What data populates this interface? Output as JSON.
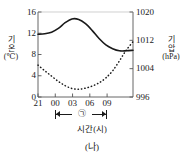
{
  "caption": "(나)",
  "chart_data": {
    "type": "line",
    "title": "",
    "subtitle": "",
    "xlabel": "시간(시)",
    "x_tick_labels": [
      "21",
      "00",
      "03",
      "06",
      "09"
    ],
    "x_tick_hours": [
      21,
      0,
      3,
      6,
      9
    ],
    "xlim_hours": [
      21,
      11
    ],
    "grid": false,
    "legend": "none",
    "axes": [
      {
        "id": "left",
        "label": "기온",
        "label_line1": "기",
        "label_line2": "온",
        "unit": "(℃)",
        "ylim": [
          0,
          16
        ],
        "ticks": [
          0,
          4,
          8,
          12,
          16
        ],
        "tick_labels": [
          "0",
          "4",
          "8",
          "12",
          "16"
        ]
      },
      {
        "id": "right",
        "label": "기압",
        "label_line1": "기",
        "label_line2": "압",
        "unit": "(hPa)",
        "ylim": [
          996,
          1020
        ],
        "ticks": [
          996,
          1004,
          1012,
          1020
        ],
        "tick_labels": [
          "996",
          "1004",
          "1012",
          "1020"
        ]
      }
    ],
    "series": [
      {
        "name": "기온",
        "axis": "left",
        "style": "solid",
        "color": "#1a1a1a",
        "unit": "℃",
        "x": [
          21,
          22,
          23,
          0,
          1,
          2,
          3,
          4,
          5,
          6,
          7,
          8,
          9,
          10,
          11
        ],
        "values": [
          11.8,
          11.9,
          12.2,
          12.9,
          14.0,
          14.7,
          14.6,
          13.8,
          12.5,
          11.0,
          9.8,
          9.1,
          8.7,
          8.7,
          8.8
        ]
      },
      {
        "name": "기압",
        "axis": "right",
        "style": "dotted",
        "color": "#1a1a1a",
        "unit": "hPa",
        "x": [
          21,
          22,
          23,
          0,
          1,
          2,
          3,
          4,
          5,
          6,
          7,
          8,
          9,
          10,
          11
        ],
        "values": [
          1005.0,
          1003.4,
          1001.9,
          1000.4,
          999.2,
          998.4,
          998.2,
          998.5,
          999.1,
          1000.0,
          1001.4,
          1003.4,
          1006.2,
          1009.2,
          1011.6
        ]
      }
    ],
    "annotations": [
      {
        "name": "span-bracket",
        "label": "㉠",
        "x_start_hour": 0,
        "x_end_hour": 8,
        "style": "double-arrow"
      }
    ]
  }
}
